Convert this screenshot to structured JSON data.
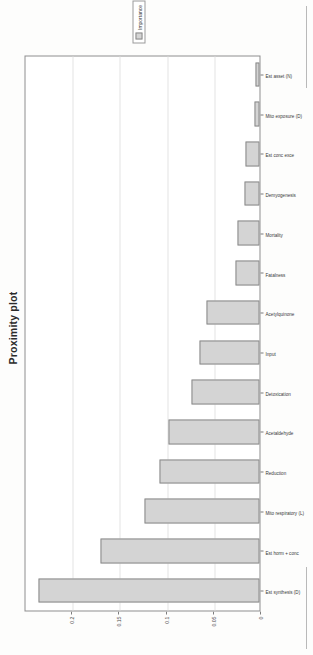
{
  "figure": {
    "title": "Proximity plot",
    "legend": {
      "entries": [
        {
          "label": "Importance",
          "color": "#d4d4d4"
        }
      ]
    }
  },
  "chart_data": {
    "type": "bar",
    "title": "Proximity plot",
    "xlabel": "",
    "ylabel": "",
    "ylim": [
      0,
      0.25
    ],
    "grid": true,
    "legend_position": "right",
    "orientation": "vertical",
    "bar_color": "#d4d4d4",
    "bar_edge_color": "#8a8a8a",
    "yticks": [
      0,
      0.05,
      0.1,
      0.15,
      0.2
    ],
    "ytick_labels": [
      "0",
      "0.05",
      "0.1",
      "0.15",
      "0.2"
    ],
    "categories": [
      "Est synthesis (D)",
      "Est horm + conc",
      "Mito respiratory (L)",
      "Reduction",
      "Acetaldehyde",
      "Detoxication",
      "Input",
      "Acetylquinone",
      "Fatalness",
      "Mortality",
      "Demyogenesis",
      "Est conc exce",
      "Mito exposure (D)",
      "Est asset (N)"
    ],
    "values": [
      0.234,
      0.168,
      0.122,
      0.106,
      0.096,
      0.072,
      0.064,
      0.056,
      0.025,
      0.023,
      0.016,
      0.015,
      0.005,
      0.004
    ],
    "series": [
      {
        "name": "Importance",
        "values": [
          0.234,
          0.168,
          0.122,
          0.106,
          0.096,
          0.072,
          0.064,
          0.056,
          0.025,
          0.023,
          0.016,
          0.015,
          0.005,
          0.004
        ]
      }
    ]
  }
}
